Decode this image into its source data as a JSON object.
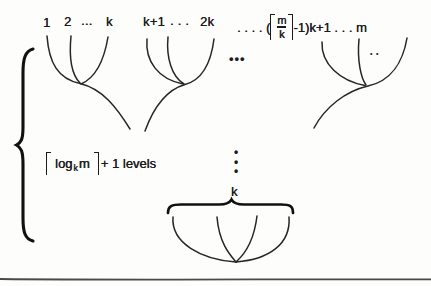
{
  "figure": {
    "background": "#fdfdfc",
    "ink": "#1b1b1b",
    "rule_color": "#4a4a4a"
  },
  "labels": {
    "group1": {
      "n1": "1",
      "n2": "2",
      "dots": "...",
      "nk": "k"
    },
    "group2": {
      "start": "k+1",
      "dots": ". . .",
      "end": "2k"
    },
    "group3": {
      "prefix": ". . . . (",
      "frac_num": "m",
      "frac_den": "k",
      "suffix": "-1)k+1 . . . m"
    },
    "levels": {
      "log": "log",
      "sub_k": "k",
      "m": "m",
      "suffix": "+ 1 levels"
    },
    "bottom_k": "k"
  },
  "dots": {
    "mid_ellipsis": "•••",
    "fan3_inner": "••",
    "vertical": "•\n•\n•"
  }
}
